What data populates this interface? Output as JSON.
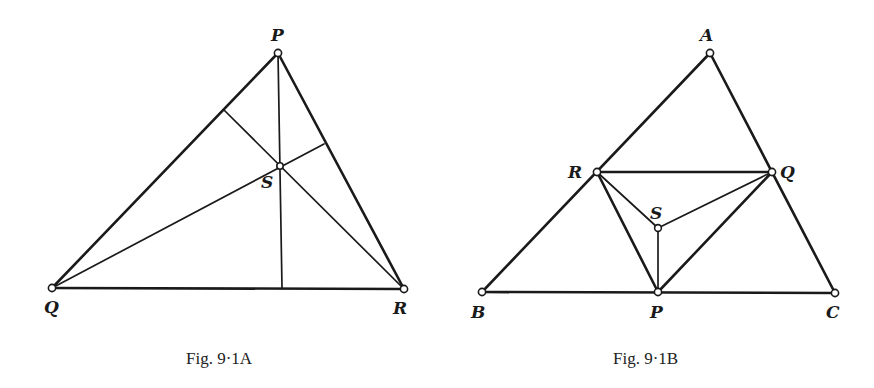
{
  "figures": [
    {
      "id": "A",
      "caption": "Fig. 9·1A",
      "points": {
        "P": {
          "label": "P",
          "x": 278,
          "y": 53
        },
        "Q": {
          "label": "Q",
          "x": 52,
          "y": 288
        },
        "R": {
          "label": "R",
          "x": 404,
          "y": 289
        },
        "S": {
          "label": "S",
          "x": 280,
          "y": 166
        }
      },
      "feet": {
        "on_PQ": {
          "x": 224,
          "y": 110
        },
        "on_PR": {
          "x": 324,
          "y": 144
        },
        "on_QR": {
          "x": 282,
          "y": 288
        }
      }
    },
    {
      "id": "B",
      "caption": "Fig. 9·1B",
      "points": {
        "A": {
          "label": "A",
          "x": 710,
          "y": 53
        },
        "R": {
          "label": "R",
          "x": 597,
          "y": 172
        },
        "Q": {
          "label": "Q",
          "x": 772,
          "y": 172
        },
        "S": {
          "label": "S",
          "x": 658,
          "y": 228
        },
        "B": {
          "label": "B",
          "x": 482,
          "y": 292
        },
        "P": {
          "label": "P",
          "x": 658,
          "y": 292
        },
        "C": {
          "label": "C",
          "x": 835,
          "y": 293
        }
      }
    }
  ]
}
